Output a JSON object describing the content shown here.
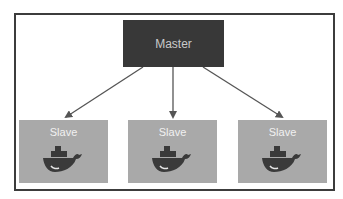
{
  "diagram": {
    "type": "master-slave topology",
    "master": {
      "label": "Master"
    },
    "slaves": [
      {
        "label": "Slave",
        "icon": "docker-whale-icon"
      },
      {
        "label": "Slave",
        "icon": "docker-whale-icon"
      },
      {
        "label": "Slave",
        "icon": "docker-whale-icon"
      }
    ],
    "edges": [
      {
        "from": "Master",
        "to": "Slave 1"
      },
      {
        "from": "Master",
        "to": "Slave 2"
      },
      {
        "from": "Master",
        "to": "Slave 3"
      }
    ],
    "colors": {
      "master_fill": "#383838",
      "master_text": "#c9c9c9",
      "slave_fill": "#a9a9a9",
      "slave_text": "#f1f1f1",
      "arrow": "#555555",
      "frame": "#3c3c3c"
    }
  }
}
